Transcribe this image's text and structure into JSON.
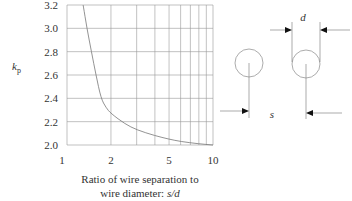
{
  "chart_data": {
    "type": "line",
    "title": "",
    "ylabel": "k",
    "ylabel_sub": "p",
    "xlabel_line1": "Ratio of wire separation to",
    "xlabel_line2_prefix": "wire diameter: ",
    "xlabel_line2_var": "s/d",
    "xscale": "log",
    "xlim": [
      1,
      10
    ],
    "ylim": [
      2.0,
      3.2
    ],
    "x_ticks": [
      {
        "value": 1,
        "label": "1"
      },
      {
        "value": 2,
        "label": "2"
      },
      {
        "value": 5,
        "label": "5"
      },
      {
        "value": 10,
        "label": "10"
      }
    ],
    "x_gridlines": [
      1,
      2,
      3,
      4,
      5,
      6,
      7,
      8,
      9,
      10
    ],
    "y_ticks": [
      {
        "value": 2.0,
        "label": "2.0"
      },
      {
        "value": 2.2,
        "label": "2.2"
      },
      {
        "value": 2.4,
        "label": "2.4"
      },
      {
        "value": 2.6,
        "label": "2.6"
      },
      {
        "value": 2.8,
        "label": "2.8"
      },
      {
        "value": 3.0,
        "label": "3.0"
      },
      {
        "value": 3.2,
        "label": "3.2"
      }
    ],
    "grid": true,
    "series": [
      {
        "name": "kp",
        "x": [
          1.29,
          1.37,
          1.47,
          1.58,
          1.71,
          1.85,
          2.0,
          2.5,
          3.0,
          4.0,
          5.0,
          6.0,
          8.0,
          10.0
        ],
        "y": [
          3.2,
          3.0,
          2.8,
          2.6,
          2.4,
          2.32,
          2.27,
          2.18,
          2.13,
          2.08,
          2.05,
          2.03,
          2.01,
          2.0
        ]
      }
    ]
  },
  "diagram": {
    "label_d": "d",
    "label_s": "s"
  }
}
